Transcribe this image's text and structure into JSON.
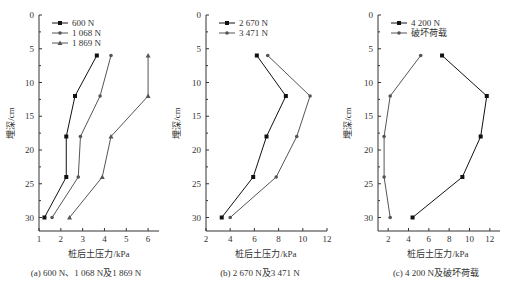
{
  "chart_data": [
    {
      "type": "line",
      "title": "(a) 600 N、1 068 N及1 869 N",
      "xlabel": "桩后土压力/kPa",
      "ylabel": "埋深/cm",
      "xlim": [
        1,
        6.5
      ],
      "ylim": [
        32,
        0
      ],
      "xticks": [
        "1",
        "2",
        "3",
        "4",
        "5",
        "6"
      ],
      "yticks": [
        "0",
        "5",
        "10",
        "15",
        "20",
        "25",
        "30"
      ],
      "y": [
        6,
        12,
        18,
        24,
        30
      ],
      "series": [
        {
          "name": "600 N",
          "marker": "square",
          "values": [
            3.65,
            2.65,
            2.25,
            2.25,
            1.25
          ]
        },
        {
          "name": "1 068 N",
          "marker": "circle",
          "values": [
            4.3,
            3.8,
            2.9,
            2.8,
            1.6
          ]
        },
        {
          "name": "1 869 N",
          "marker": "triangle",
          "values": [
            6.0,
            6.0,
            4.3,
            3.9,
            2.4
          ]
        }
      ],
      "legend_position": "upper-left"
    },
    {
      "type": "line",
      "title": "(b) 2 670 N及3 471 N",
      "xlabel": "桩后土压力/kPa",
      "ylabel": "埋深/cm",
      "xlim": [
        2,
        12
      ],
      "ylim": [
        32,
        0
      ],
      "xticks": [
        "2",
        "4",
        "6",
        "8",
        "10",
        "12"
      ],
      "yticks": [
        "0",
        "5",
        "10",
        "15",
        "20",
        "25",
        "30"
      ],
      "y": [
        6,
        12,
        18,
        24,
        30
      ],
      "series": [
        {
          "name": "2 670 N",
          "marker": "square",
          "values": [
            6.2,
            8.6,
            7.0,
            5.9,
            3.3
          ]
        },
        {
          "name": "3 471 N",
          "marker": "circle",
          "values": [
            7.1,
            10.6,
            9.5,
            7.8,
            4.0
          ]
        }
      ],
      "legend_position": "upper-left"
    },
    {
      "type": "line",
      "title": "(c) 4 200 N及破坏荷载",
      "xlabel": "桩后土压力/kPa",
      "ylabel": "埋深/cm",
      "xlim": [
        1,
        13
      ],
      "ylim": [
        32,
        0
      ],
      "xticks": [
        "2",
        "4",
        "6",
        "8",
        "10",
        "12"
      ],
      "yticks": [
        "0",
        "5",
        "10",
        "15",
        "20",
        "25",
        "30"
      ],
      "y": [
        6,
        12,
        18,
        24,
        30
      ],
      "series": [
        {
          "name": "4 200 N",
          "marker": "square",
          "values": [
            7.3,
            11.7,
            11.1,
            9.3,
            4.4
          ]
        },
        {
          "name": "破坏荷载",
          "marker": "circle",
          "values": [
            5.2,
            2.2,
            1.6,
            1.6,
            2.2
          ]
        }
      ],
      "legend_position": "upper-left"
    }
  ]
}
